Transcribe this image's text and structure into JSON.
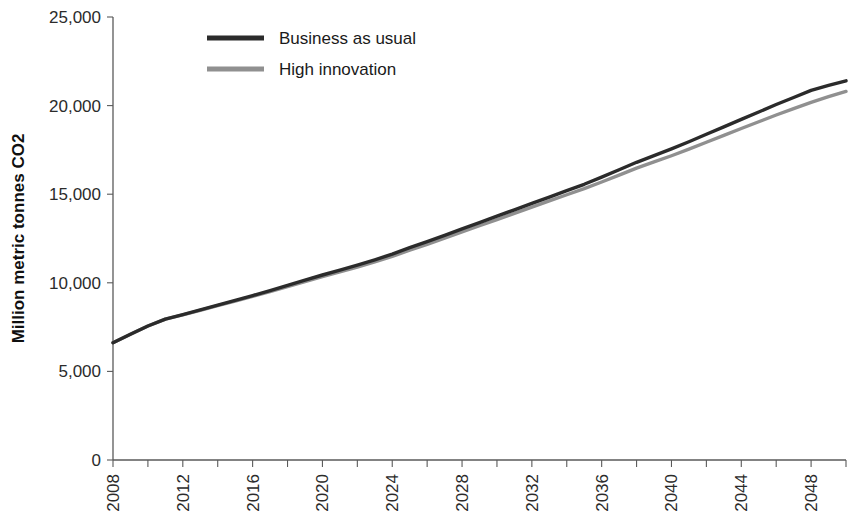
{
  "chart_data": {
    "type": "line",
    "title": "",
    "xlabel": "",
    "ylabel": "Million metric tonnes CO2",
    "xlim": [
      2008,
      2050
    ],
    "ylim": [
      0,
      25000
    ],
    "grid": false,
    "legend_position": "top-center",
    "y_ticks": [
      0,
      5000,
      10000,
      15000,
      20000,
      25000
    ],
    "y_tick_labels": [
      "0",
      "5,000",
      "10,000",
      "15,000",
      "20,000",
      "25,000"
    ],
    "x_tick_labels": [
      "2008",
      "2012",
      "2016",
      "2020",
      "2024",
      "2028",
      "2032",
      "2036",
      "2040",
      "2044",
      "2048"
    ],
    "x_minor_step": 2,
    "x_major_step": 4,
    "x": [
      2008,
      2009,
      2010,
      2011,
      2012,
      2013,
      2014,
      2015,
      2016,
      2017,
      2018,
      2019,
      2020,
      2021,
      2022,
      2023,
      2024,
      2025,
      2026,
      2027,
      2028,
      2029,
      2030,
      2031,
      2032,
      2033,
      2034,
      2035,
      2036,
      2037,
      2038,
      2039,
      2040,
      2041,
      2042,
      2043,
      2044,
      2045,
      2046,
      2047,
      2048,
      2049,
      2050
    ],
    "series": [
      {
        "name": "Business as usual",
        "color": "#2b2b2b",
        "values": [
          6620,
          7100,
          7560,
          7950,
          8200,
          8470,
          8740,
          9010,
          9280,
          9560,
          9850,
          10150,
          10440,
          10720,
          11000,
          11300,
          11620,
          11980,
          12320,
          12680,
          13040,
          13400,
          13760,
          14120,
          14480,
          14840,
          15200,
          15560,
          15960,
          16380,
          16800,
          17180,
          17560,
          17960,
          18380,
          18800,
          19220,
          19640,
          20060,
          20460,
          20860,
          21140,
          21400
        ]
      },
      {
        "name": "High innovation",
        "color": "#909090",
        "values": [
          6620,
          7100,
          7560,
          7950,
          8190,
          8450,
          8710,
          8970,
          9230,
          9500,
          9780,
          10070,
          10350,
          10620,
          10890,
          11180,
          11490,
          11840,
          12170,
          12520,
          12870,
          13220,
          13570,
          13920,
          14270,
          14620,
          14970,
          15310,
          15690,
          16080,
          16470,
          16820,
          17170,
          17540,
          17930,
          18320,
          18710,
          19090,
          19470,
          19830,
          20180,
          20500,
          20800
        ]
      }
    ]
  },
  "legend": {
    "items": [
      {
        "label": "Business as usual",
        "color": "#2b2b2b"
      },
      {
        "label": "High innovation",
        "color": "#909090"
      }
    ]
  },
  "axis": {
    "y_title": "Million metric tonnes CO2"
  }
}
